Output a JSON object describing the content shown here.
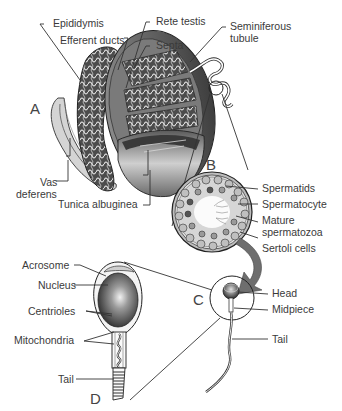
{
  "figure": {
    "panels": {
      "A": "A",
      "B": "B",
      "C": "C",
      "D": "D"
    },
    "panel_a_labels": {
      "epididymis": "Epididymis",
      "efferent_ducts": "Efferent ducts",
      "rete_testis": "Rete testis",
      "septa": "Septa",
      "seminiferous_tubule_1": "Seminiferous",
      "seminiferous_tubule_2": "tubule",
      "vas_deferens_1": "Vas",
      "vas_deferens_2": "deferens",
      "tunica_albuginea": "Tunica albuginea"
    },
    "panel_b_labels": {
      "spermatids": "Spermatids",
      "spermatocyte": "Spermatocyte",
      "mature_spermatozoa_1": "Mature",
      "mature_spermatozoa_2": "spermatozoa",
      "sertoli_cells": "Sertoli cells"
    },
    "panel_c_labels": {
      "head": "Head",
      "midpiece": "Midpiece",
      "tail": "Tail"
    },
    "panel_d_labels": {
      "acrosome": "Acrosome",
      "nucleus": "Nucleus",
      "centrioles": "Centrioles",
      "mitochondria": "Mitochondria",
      "tail": "Tail"
    },
    "colors": {
      "line": "#333333",
      "fill_dark": "#4a4a4a",
      "fill_mid": "#8a8a8a",
      "fill_light": "#d8d8d8",
      "arrow": "#6e6e6e",
      "background": "#ffffff"
    }
  }
}
